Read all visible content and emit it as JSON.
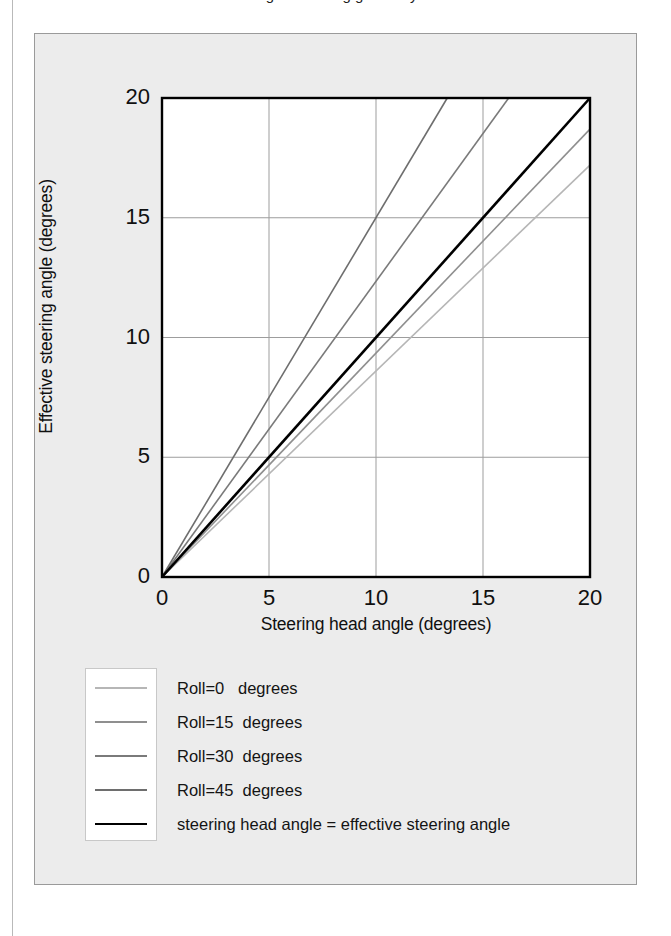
{
  "page": {
    "caption_sliver": "Fig.  a  Steering geometry"
  },
  "chart_data": {
    "type": "line",
    "title": "",
    "xlabel": "Steering head angle (degrees)",
    "ylabel": "Effective steering angle (degrees)",
    "xlim": [
      0,
      20
    ],
    "ylim": [
      0,
      20
    ],
    "xticks": [
      0,
      5,
      10,
      15,
      20
    ],
    "yticks": [
      0,
      5,
      10,
      15,
      20
    ],
    "grid": true,
    "legend_position": "below-left",
    "series": [
      {
        "name": "Roll=0   degrees",
        "roll": 0,
        "color": "#b6b6b6",
        "width": 1.6,
        "slope": 0.86,
        "x": [
          0,
          20
        ],
        "y": [
          0,
          17.2
        ]
      },
      {
        "name": "Roll=15  degrees",
        "roll": 15,
        "color": "#8f8f8f",
        "width": 1.6,
        "slope": 0.935,
        "x": [
          0,
          20
        ],
        "y": [
          0,
          18.7
        ]
      },
      {
        "name": "Roll=30  degrees",
        "roll": 30,
        "color": "#7a7a7a",
        "width": 1.6,
        "slope": 1.235,
        "x": [
          0,
          16.2
        ],
        "y": [
          0,
          20
        ]
      },
      {
        "name": "Roll=45  degrees",
        "roll": 45,
        "color": "#6e6e6e",
        "width": 1.6,
        "slope": 1.5,
        "x": [
          0,
          13.33
        ],
        "y": [
          0,
          20
        ]
      },
      {
        "name": "steering head angle = effective steering angle",
        "color": "#000000",
        "width": 2.6,
        "slope": 1.0,
        "x": [
          0,
          20
        ],
        "y": [
          0,
          20
        ]
      }
    ]
  },
  "legend": {
    "entries": [
      {
        "label": "Roll=0   degrees"
      },
      {
        "label": "Roll=15  degrees"
      },
      {
        "label": "Roll=30  degrees"
      },
      {
        "label": "Roll=45  degrees"
      },
      {
        "label": "steering head angle = effective steering angle"
      }
    ]
  }
}
